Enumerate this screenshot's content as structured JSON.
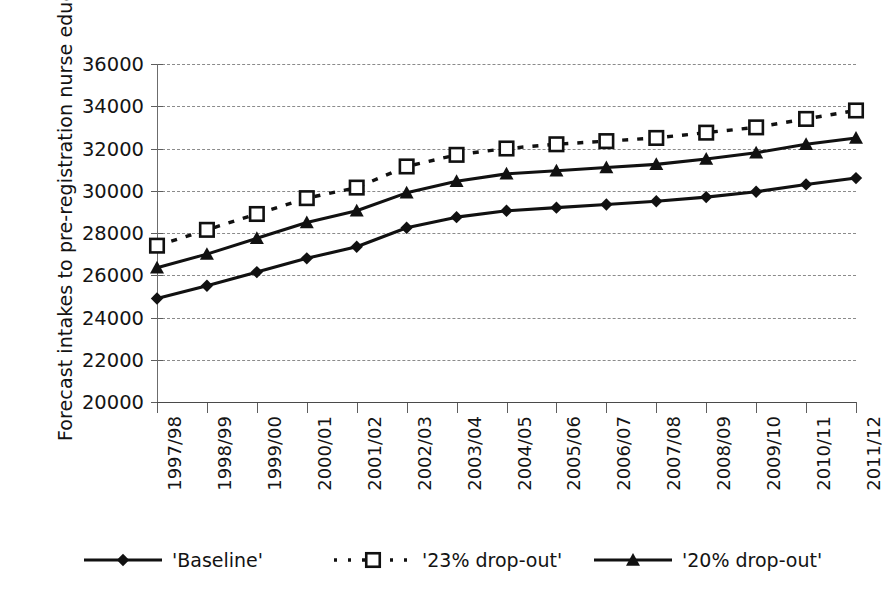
{
  "chart_data": {
    "type": "line",
    "title": "",
    "subtitle": "",
    "xlabel": "",
    "ylabel": "Forecast intakes to pre-registration nurse education",
    "ylim": [
      20000,
      36000
    ],
    "ytick_step": 2000,
    "yticks": [
      "36000",
      "34000",
      "32000",
      "30000",
      "28000",
      "26000",
      "24000",
      "22000",
      "20000"
    ],
    "grid": true,
    "legend_position": "bottom",
    "categories": [
      "1997/98",
      "1998/99",
      "1999/00",
      "2000/01",
      "2001/02",
      "2002/03",
      "2003/04",
      "2004/05",
      "2005/06",
      "2006/07",
      "2007/08",
      "2008/09",
      "2009/10",
      "2010/11",
      "2011/12"
    ],
    "series": [
      {
        "name": "'Baseline'",
        "marker": "diamond",
        "line_style": "solid",
        "color": "#111111",
        "values": [
          24900,
          25500,
          26150,
          26800,
          27350,
          28250,
          28750,
          29050,
          29200,
          29350,
          29500,
          29700,
          29950,
          30300,
          30600
        ]
      },
      {
        "name": "'23% drop-out'",
        "marker": "open-square",
        "line_style": "dotted",
        "color": "#111111",
        "values": [
          27400,
          28150,
          28900,
          29650,
          30150,
          31150,
          31700,
          32000,
          32200,
          32350,
          32500,
          32750,
          33000,
          33400,
          33800
        ]
      },
      {
        "name": "'20% drop-out'",
        "marker": "triangle",
        "line_style": "solid",
        "color": "#111111",
        "values": [
          26350,
          27000,
          27750,
          28500,
          29050,
          29900,
          30450,
          30800,
          30950,
          31100,
          31250,
          31500,
          31800,
          32200,
          32500
        ]
      }
    ]
  },
  "legend": {
    "entries": [
      {
        "label": "'Baseline'",
        "marker": "diamond",
        "line_style": "solid"
      },
      {
        "label": "'23% drop-out'",
        "marker": "open-square",
        "line_style": "dotted"
      },
      {
        "label": "'20% drop-out'",
        "marker": "triangle",
        "line_style": "solid"
      }
    ]
  },
  "colors": {
    "ink": "#111111",
    "grid": "#8b8b8b",
    "axis": "#5d5d5d",
    "background": "#ffffff"
  }
}
